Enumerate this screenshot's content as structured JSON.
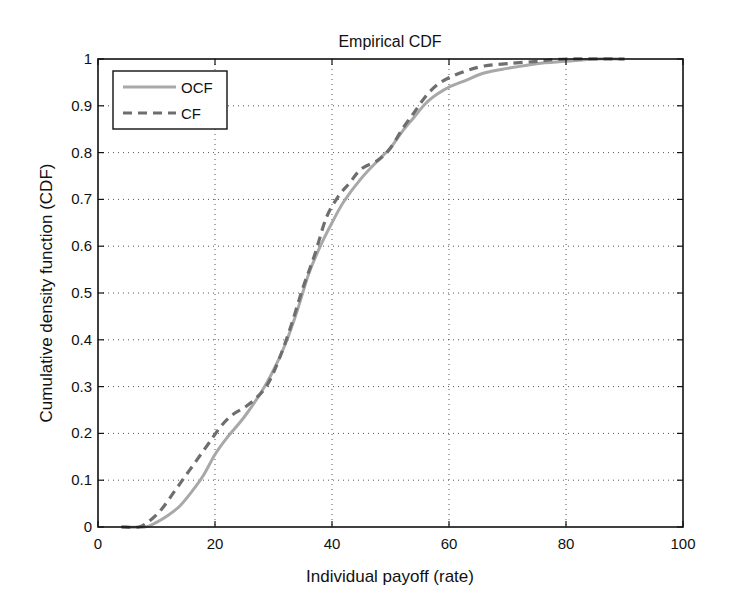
{
  "chart_data": {
    "type": "line",
    "title": "Empirical CDF",
    "xlabel": "Individual payoff (rate)",
    "ylabel": "Cumulative density function (CDF)",
    "xlim": [
      0,
      100
    ],
    "ylim": [
      0,
      1
    ],
    "xticks": [
      0,
      20,
      40,
      60,
      80,
      100
    ],
    "yticks": [
      0,
      0.1,
      0.2,
      0.3,
      0.4,
      0.5,
      0.6,
      0.7,
      0.8,
      0.9,
      1
    ],
    "ytick_labels": [
      "0",
      "0.1",
      "0.2",
      "0.3",
      "0.4",
      "0.5",
      "0.6",
      "0.7",
      "0.8",
      "0.9",
      "1"
    ],
    "grid": true,
    "legend_position": "upper left",
    "series": [
      {
        "name": "OCF",
        "style": "solid",
        "color": "#a8a8a8",
        "x": [
          4,
          8,
          10,
          12,
          14,
          16,
          18,
          20,
          22,
          25,
          28,
          30,
          32,
          34,
          36,
          38,
          40,
          42,
          45,
          48,
          50,
          52,
          54,
          56,
          58,
          60,
          63,
          66,
          70,
          75,
          80,
          85,
          90
        ],
        "y": [
          0,
          0,
          0.01,
          0.025,
          0.045,
          0.075,
          0.11,
          0.155,
          0.19,
          0.235,
          0.29,
          0.335,
          0.39,
          0.46,
          0.54,
          0.6,
          0.65,
          0.695,
          0.745,
          0.785,
          0.81,
          0.845,
          0.875,
          0.905,
          0.925,
          0.94,
          0.955,
          0.97,
          0.98,
          0.99,
          0.995,
          1.0,
          1.0
        ]
      },
      {
        "name": "CF",
        "style": "dashed",
        "color": "#6e6e6e",
        "x": [
          4,
          7,
          9,
          11,
          13,
          15,
          17,
          19,
          21,
          23,
          25,
          27,
          29,
          31,
          33,
          35,
          37,
          39,
          41,
          43,
          45,
          48,
          50,
          52,
          54,
          56,
          58,
          60,
          63,
          66,
          70,
          75,
          80,
          90
        ],
        "y": [
          0,
          0,
          0.015,
          0.04,
          0.075,
          0.11,
          0.145,
          0.18,
          0.215,
          0.24,
          0.255,
          0.275,
          0.305,
          0.36,
          0.43,
          0.51,
          0.58,
          0.66,
          0.705,
          0.735,
          0.765,
          0.785,
          0.81,
          0.85,
          0.885,
          0.92,
          0.945,
          0.96,
          0.975,
          0.985,
          0.99,
          0.995,
          1.0,
          1.0
        ]
      }
    ]
  },
  "legend": {
    "items": [
      {
        "label": "OCF"
      },
      {
        "label": "CF"
      }
    ]
  }
}
